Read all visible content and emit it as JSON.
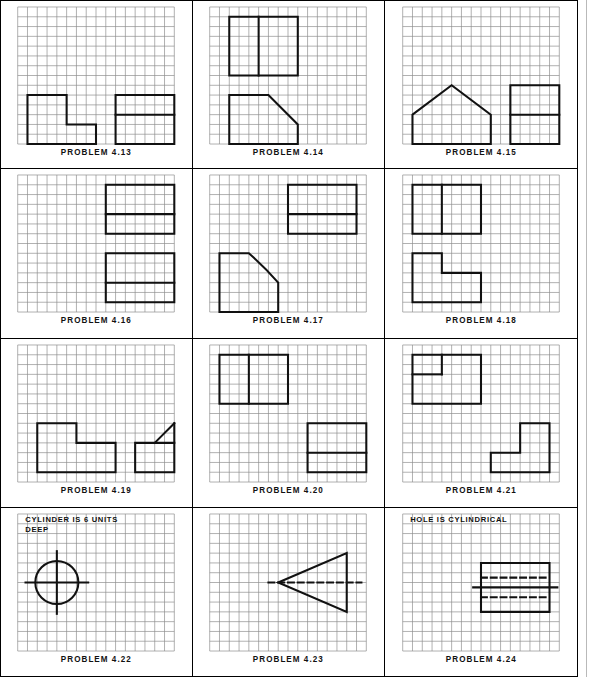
{
  "page": {
    "columns": 3,
    "rows": 4,
    "grid": {
      "cols": 16,
      "rows": 14,
      "cell": 10,
      "line_color": "#8c8c8c",
      "object_line_color": "#111111"
    }
  },
  "panels": [
    {
      "id": "p413",
      "label": "PROBLEM 4.13",
      "note": null,
      "shapes": [
        {
          "name": "stepped-block-left",
          "type": "polyline",
          "closed": true,
          "points": [
            [
              1,
              9
            ],
            [
              5,
              9
            ],
            [
              5,
              12
            ],
            [
              8,
              12
            ],
            [
              8,
              14
            ],
            [
              1,
              14
            ]
          ]
        },
        {
          "name": "rectangle-right",
          "type": "polyline",
          "closed": true,
          "points": [
            [
              10,
              9
            ],
            [
              16,
              9
            ],
            [
              16,
              14
            ],
            [
              10,
              14
            ]
          ]
        },
        {
          "name": "rectangle-right-divider",
          "type": "line",
          "points": [
            [
              10,
              11
            ],
            [
              16,
              11
            ]
          ]
        }
      ]
    },
    {
      "id": "p414",
      "label": "PROBLEM 4.14",
      "note": null,
      "shapes": [
        {
          "name": "divided-rectangle-top",
          "type": "polyline",
          "closed": true,
          "points": [
            [
              2,
              1
            ],
            [
              9,
              1
            ],
            [
              9,
              7
            ],
            [
              2,
              7
            ]
          ]
        },
        {
          "name": "divided-rectangle-top-divider",
          "type": "line",
          "points": [
            [
              5,
              1
            ],
            [
              5,
              7
            ]
          ]
        },
        {
          "name": "chamfered-block-bottom",
          "type": "polyline",
          "closed": true,
          "points": [
            [
              2,
              9
            ],
            [
              6,
              9
            ],
            [
              9,
              12
            ],
            [
              9,
              14
            ],
            [
              2,
              14
            ]
          ]
        }
      ]
    },
    {
      "id": "p415",
      "label": "PROBLEM 4.15",
      "note": null,
      "shapes": [
        {
          "name": "gable-house-shape",
          "type": "polyline",
          "closed": true,
          "points": [
            [
              1,
              11
            ],
            [
              5,
              8
            ],
            [
              9,
              11
            ],
            [
              9,
              14
            ],
            [
              1,
              14
            ]
          ]
        },
        {
          "name": "rectangle-right",
          "type": "polyline",
          "closed": true,
          "points": [
            [
              11,
              8
            ],
            [
              16,
              8
            ],
            [
              16,
              14
            ],
            [
              11,
              14
            ]
          ]
        },
        {
          "name": "rectangle-right-divider",
          "type": "line",
          "points": [
            [
              11,
              11
            ],
            [
              16,
              11
            ]
          ]
        }
      ]
    },
    {
      "id": "p416",
      "label": "PROBLEM 4.16",
      "note": null,
      "shapes": [
        {
          "name": "rectangle-upper",
          "type": "polyline",
          "closed": true,
          "points": [
            [
              9,
              1
            ],
            [
              16,
              1
            ],
            [
              16,
              6
            ],
            [
              9,
              6
            ]
          ]
        },
        {
          "name": "rectangle-upper-divider",
          "type": "line",
          "points": [
            [
              9,
              4
            ],
            [
              16,
              4
            ]
          ]
        },
        {
          "name": "rectangle-lower",
          "type": "polyline",
          "closed": true,
          "points": [
            [
              9,
              8
            ],
            [
              16,
              8
            ],
            [
              16,
              13
            ],
            [
              9,
              13
            ]
          ]
        },
        {
          "name": "rectangle-lower-divider",
          "type": "line",
          "points": [
            [
              9,
              11
            ],
            [
              16,
              11
            ]
          ]
        }
      ]
    },
    {
      "id": "p417",
      "label": "PROBLEM 4.17",
      "note": null,
      "shapes": [
        {
          "name": "rectangle-upper-right",
          "type": "polyline",
          "closed": true,
          "points": [
            [
              8,
              1
            ],
            [
              15,
              1
            ],
            [
              15,
              6
            ],
            [
              8,
              6
            ]
          ]
        },
        {
          "name": "rectangle-upper-right-divider",
          "type": "line",
          "points": [
            [
              8,
              4
            ],
            [
              15,
              4
            ]
          ]
        },
        {
          "name": "filleted-block-lower-left",
          "type": "path",
          "d": "M 1,8 L 4,8 A 3,3 0 0 1 7,11 L 7,14 L 1,14 Z"
        }
      ]
    },
    {
      "id": "p418",
      "label": "PROBLEM 4.18",
      "note": null,
      "shapes": [
        {
          "name": "divided-rectangle-top",
          "type": "polyline",
          "closed": true,
          "points": [
            [
              1,
              1
            ],
            [
              8,
              1
            ],
            [
              8,
              6
            ],
            [
              1,
              6
            ]
          ]
        },
        {
          "name": "divided-rectangle-top-divider",
          "type": "line",
          "points": [
            [
              4,
              1
            ],
            [
              4,
              6
            ]
          ]
        },
        {
          "name": "l-shape-bottom",
          "type": "polyline",
          "closed": true,
          "points": [
            [
              1,
              8
            ],
            [
              4,
              8
            ],
            [
              4,
              10
            ],
            [
              8,
              10
            ],
            [
              8,
              13
            ],
            [
              1,
              13
            ]
          ]
        }
      ]
    },
    {
      "id": "p419",
      "label": "PROBLEM 4.19",
      "note": null,
      "shapes": [
        {
          "name": "l-shape-left",
          "type": "polyline",
          "closed": true,
          "points": [
            [
              2,
              8
            ],
            [
              6,
              8
            ],
            [
              6,
              10
            ],
            [
              10,
              10
            ],
            [
              10,
              13
            ],
            [
              2,
              13
            ]
          ]
        },
        {
          "name": "rectangle-right",
          "type": "polyline",
          "closed": true,
          "points": [
            [
              12,
              10
            ],
            [
              16,
              10
            ],
            [
              16,
              13
            ],
            [
              12,
              13
            ]
          ]
        },
        {
          "name": "diagonal-line-right",
          "type": "line",
          "points": [
            [
              14,
              10
            ],
            [
              16,
              8
            ]
          ]
        },
        {
          "name": "right-edge-riser",
          "type": "line",
          "points": [
            [
              16,
              8
            ],
            [
              16,
              10
            ]
          ]
        }
      ]
    },
    {
      "id": "p420",
      "label": "PROBLEM 4.20",
      "note": null,
      "shapes": [
        {
          "name": "divided-rectangle-top",
          "type": "polyline",
          "closed": true,
          "points": [
            [
              1,
              1
            ],
            [
              8,
              1
            ],
            [
              8,
              6
            ],
            [
              1,
              6
            ]
          ]
        },
        {
          "name": "divided-rectangle-top-divider",
          "type": "line",
          "points": [
            [
              4,
              1
            ],
            [
              4,
              6
            ]
          ]
        },
        {
          "name": "rectangle-bottom-right",
          "type": "polyline",
          "closed": true,
          "points": [
            [
              10,
              8
            ],
            [
              16,
              8
            ],
            [
              16,
              13
            ],
            [
              10,
              13
            ]
          ]
        },
        {
          "name": "rectangle-bottom-right-divider",
          "type": "line",
          "points": [
            [
              10,
              11
            ],
            [
              16,
              11
            ]
          ]
        }
      ]
    },
    {
      "id": "p421",
      "label": "PROBLEM 4.21",
      "note": null,
      "shapes": [
        {
          "name": "notched-rectangle-top",
          "type": "polyline",
          "closed": true,
          "points": [
            [
              1,
              1
            ],
            [
              8,
              1
            ],
            [
              8,
              6
            ],
            [
              1,
              6
            ]
          ]
        },
        {
          "name": "notch-vertical",
          "type": "line",
          "points": [
            [
              4,
              1
            ],
            [
              4,
              3
            ]
          ]
        },
        {
          "name": "notch-horizontal",
          "type": "line",
          "points": [
            [
              1,
              3
            ],
            [
              4,
              3
            ]
          ]
        },
        {
          "name": "l-shape-bottom-right",
          "type": "polyline",
          "closed": true,
          "points": [
            [
              12,
              8
            ],
            [
              15,
              8
            ],
            [
              15,
              13
            ],
            [
              9,
              13
            ],
            [
              9,
              11
            ],
            [
              12,
              11
            ]
          ]
        }
      ]
    },
    {
      "id": "p422",
      "label": "PROBLEM 4.22",
      "note": "CYLINDER IS 6 UNITS\nDEEP",
      "note_pos": [
        1,
        0.15
      ],
      "shapes": [
        {
          "name": "circle-outline",
          "type": "circle",
          "center": [
            4,
            7
          ],
          "r": 2.2
        },
        {
          "name": "centerline-horizontal",
          "type": "line",
          "points": [
            [
              0.8,
              7
            ],
            [
              7.2,
              7
            ]
          ]
        },
        {
          "name": "centerline-vertical",
          "type": "line",
          "points": [
            [
              4,
              3.8
            ],
            [
              4,
              10.2
            ]
          ]
        }
      ]
    },
    {
      "id": "p423",
      "label": "PROBLEM 4.23",
      "note": null,
      "shapes": [
        {
          "name": "triangle-pointing-left",
          "type": "polyline",
          "closed": true,
          "points": [
            [
              7,
              7
            ],
            [
              14,
              4
            ],
            [
              14,
              10
            ]
          ]
        },
        {
          "name": "centerline-dashed",
          "type": "dashed-line",
          "points": [
            [
              6,
              7
            ],
            [
              15.5,
              7
            ]
          ]
        }
      ]
    },
    {
      "id": "p424",
      "label": "PROBLEM 4.24",
      "note": "HOLE IS CYLINDRICAL",
      "note_pos": [
        1,
        0.15
      ],
      "shapes": [
        {
          "name": "rectangle-outline",
          "type": "polyline",
          "closed": true,
          "points": [
            [
              8,
              5
            ],
            [
              15,
              5
            ],
            [
              15,
              10
            ],
            [
              8,
              10
            ]
          ]
        },
        {
          "name": "hidden-line-upper",
          "type": "dashed-line",
          "points": [
            [
              8,
              6.5
            ],
            [
              15,
              6.5
            ]
          ]
        },
        {
          "name": "hidden-line-lower",
          "type": "dashed-line",
          "points": [
            [
              8,
              8.5
            ],
            [
              15,
              8.5
            ]
          ]
        },
        {
          "name": "centerline-horizontal",
          "type": "line",
          "points": [
            [
              7.2,
              7.5
            ],
            [
              15.8,
              7.5
            ]
          ]
        }
      ]
    }
  ]
}
